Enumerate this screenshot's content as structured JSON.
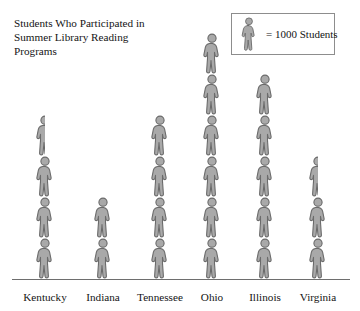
{
  "chart_data": {
    "type": "bar",
    "subtype": "pictograph",
    "xlabel": "",
    "ylabel": "",
    "categories": [
      "Kentucky",
      "Indiana",
      "Tennessee",
      "Ohio",
      "Illinois",
      "Virginia"
    ],
    "values": [
      3500,
      2000,
      4000,
      6000,
      5000,
      2500
    ],
    "icon_counts": [
      3.5,
      2,
      4,
      6,
      5,
      2.5
    ],
    "unit_per_icon": 1000,
    "grid": false,
    "legend_position": "top-right",
    "ylim": [
      0,
      6000
    ],
    "annotations": [
      "= 1000 Students"
    ]
  },
  "title": {
    "text": "Students Who Participated in\nSummer Library Reading\nPrograms"
  },
  "legend": {
    "icon_name": "person-icon",
    "text": "= 1000 Students"
  },
  "axis": {
    "categories": [
      {
        "label": "Kentucky",
        "icons": 3.5,
        "value": 3500
      },
      {
        "label": "Indiana",
        "icons": 2,
        "value": 2000
      },
      {
        "label": "Tennessee",
        "icons": 4,
        "value": 4000
      },
      {
        "label": "Ohio",
        "icons": 6,
        "value": 6000
      },
      {
        "label": "Illinois",
        "icons": 5,
        "value": 5000
      },
      {
        "label": "Virginia",
        "icons": 2.5,
        "value": 2500
      }
    ]
  },
  "colors": {
    "figure_fill": "#a9a9a9",
    "figure_stroke": "#6b6b6b",
    "baseline": "#6e6e6e",
    "legend_border": "#8d8d8d",
    "text": "#141414",
    "background": "#ffffff"
  }
}
